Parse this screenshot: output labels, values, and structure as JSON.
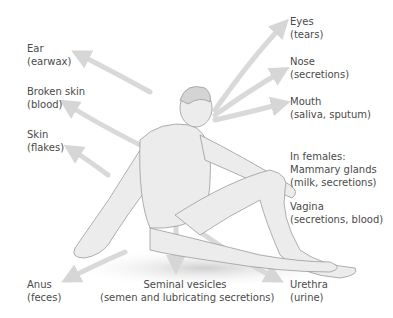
{
  "diagram": {
    "arrow_color": "#d9d9d9",
    "figure_color": "#e8e8e8",
    "labels": [
      {
        "id": "ear",
        "name": "Ear",
        "detail": "(earwax)"
      },
      {
        "id": "broken-skin",
        "name": "Broken skin",
        "detail": "(blood)"
      },
      {
        "id": "skin",
        "name": "Skin",
        "detail": "(flakes)"
      },
      {
        "id": "anus",
        "name": "Anus",
        "detail": "(feces)"
      },
      {
        "id": "seminal-vesicles",
        "name": "Seminal vesicles",
        "detail": "(semen and lubricating secretions)"
      },
      {
        "id": "urethra",
        "name": "Urethra",
        "detail": "(urine)"
      },
      {
        "id": "eyes",
        "name": "Eyes",
        "detail": "(tears)"
      },
      {
        "id": "nose",
        "name": "Nose",
        "detail": "(secretions)"
      },
      {
        "id": "mouth",
        "name": "Mouth",
        "detail": "(saliva, sputum)"
      },
      {
        "id": "mammary-glands",
        "prefix": "In females:",
        "name": "Mammary glands",
        "detail": "(milk, secretions)"
      },
      {
        "id": "vagina",
        "name": "Vagina",
        "detail": "(secretions, blood)"
      }
    ]
  }
}
